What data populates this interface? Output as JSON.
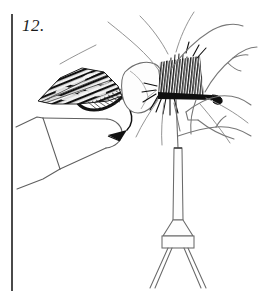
{
  "figure": {
    "step_label": "12.",
    "caption": "",
    "kind": "line-art instructional illustration"
  },
  "colors": {
    "background": "#ffffff",
    "ink": "#1a1a1a",
    "line": "#5a5a5a",
    "light_line": "#8a8a8a",
    "rule": "#4a4a4a",
    "wing_dark": "#141414",
    "wing_mid": "#3c3c3c",
    "body_fill": "#fdfdfd"
  },
  "elements": {
    "margin_rule": "vertical-rule",
    "wing": "mottled-quill-wing",
    "body": "dubbed-body",
    "hackle": "hackle-collar",
    "hook": "hook-bend-and-point",
    "thread": "tying-thread",
    "bobbin": "bobbin-tool",
    "left_hand": "thumb-and-finger",
    "right_hand": "index-finger-and-thumb",
    "feelers": "stray-fibers"
  }
}
